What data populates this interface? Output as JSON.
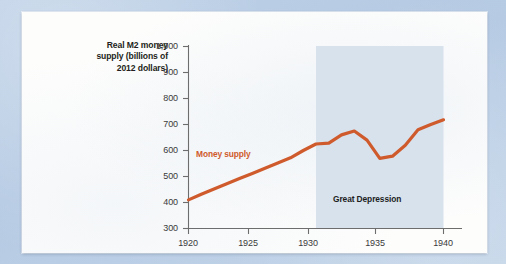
{
  "figure": {
    "background_color": "#b9cde4",
    "card_color": "#fdfdfc"
  },
  "chart_data": {
    "type": "line",
    "title": "",
    "xlabel": "",
    "ylabel": "Real M2 money supply (billions of 2012 dollars)",
    "ylabel_lines": [
      "Real M2 money",
      "supply (billions of",
      "2012 dollars)"
    ],
    "xlim": [
      1920,
      1941
    ],
    "ylim": [
      300,
      1000
    ],
    "ytick_labels": [
      "1,000",
      "900",
      "800",
      "700",
      "600",
      "500",
      "400",
      "300"
    ],
    "ytick_values": [
      1000,
      900,
      800,
      700,
      600,
      500,
      400,
      300
    ],
    "xtick_labels": [
      "1920",
      "1925",
      "1930",
      "1935",
      "1940"
    ],
    "xtick_values": [
      1920,
      1925,
      1930,
      1935,
      1940
    ],
    "grid": false,
    "legend_position": "inline-annotation",
    "line_color": "#cf5a2c",
    "line_width": 3,
    "series": [
      {
        "name": "Money supply",
        "label": "Money supply",
        "color": "#cf5a2c",
        "x": [
          1920,
          1921,
          1922,
          1923,
          1924,
          1925,
          1926,
          1927,
          1928,
          1929,
          1930,
          1931,
          1932,
          1933,
          1934,
          1935,
          1936,
          1937,
          1938,
          1939,
          1940
        ],
        "values": [
          410,
          432,
          452,
          472,
          492,
          512,
          532,
          552,
          572,
          600,
          625,
          628,
          660,
          675,
          640,
          570,
          578,
          620,
          680,
          700,
          718
        ]
      }
    ],
    "annotations": [
      {
        "name": "money-supply-label",
        "text": "Money supply",
        "x": 1921.2,
        "y": 545,
        "color": "#cf5a2c"
      },
      {
        "name": "great-depression-label",
        "text": "Great Depression",
        "x": 1934.5,
        "y": 370,
        "color": "#1d1d1d"
      }
    ],
    "shaded_regions": [
      {
        "name": "great-depression-band",
        "label": "Great Depression",
        "x_start": 1930,
        "x_end": 1940,
        "color": "#d7e2ed"
      }
    ]
  }
}
